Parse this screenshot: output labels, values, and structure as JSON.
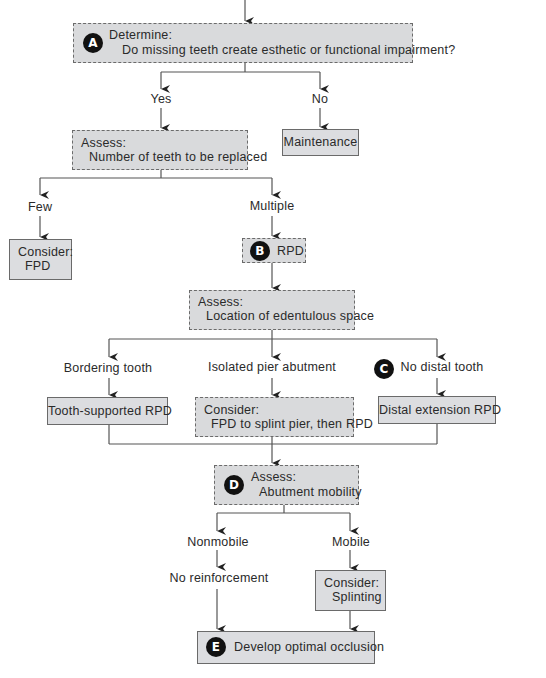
{
  "diagram": {
    "type": "flowchart",
    "nodes": {
      "A": {
        "badge": "A",
        "heading": "Determine:",
        "text": "Do missing teeth create esthetic or functional impairment?"
      },
      "yes_label": "Yes",
      "no_label": "No",
      "assess_count": {
        "heading": "Assess:",
        "text": "Number of teeth to be replaced"
      },
      "maintenance": "Maintenance",
      "few_label": "Few",
      "multiple_label": "Multiple",
      "consider_fpd": {
        "heading": "Consider:",
        "text": "FPD"
      },
      "B": {
        "badge": "B",
        "text": "RPD"
      },
      "assess_location": {
        "heading": "Assess:",
        "text": "Location of edentulous space"
      },
      "bordering_label": "Bordering tooth",
      "pier_label": "Isolated pier abutment",
      "C": {
        "badge": "C",
        "label": "No distal tooth"
      },
      "tooth_supported": "Tooth-supported RPD",
      "consider_splint_pier": {
        "heading": "Consider:",
        "text": "FPD to splint pier, then RPD"
      },
      "distal_extension": "Distal extension RPD",
      "D": {
        "badge": "D",
        "heading": "Assess:",
        "text": "Abutment mobility"
      },
      "nonmobile_label": "Nonmobile",
      "mobile_label": "Mobile",
      "no_reinforcement": "No reinforcement",
      "consider_splinting": {
        "heading": "Consider:",
        "text": "Splinting"
      },
      "E": {
        "badge": "E",
        "text": "Develop optimal occlusion"
      }
    },
    "colors": {
      "box_fill": "#d9dadc",
      "box_border": "#6b6b6b",
      "badge": "#111111",
      "line": "#555555"
    }
  }
}
